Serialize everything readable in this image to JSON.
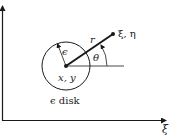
{
  "diagram": {
    "type": "geometry-figure",
    "colors": {
      "ink": "#1a1a1a",
      "background": "#ffffff"
    },
    "axes": {
      "horizontal_label": "ξ",
      "vertical_label": ""
    },
    "labels": {
      "point": "ξ, η",
      "radius_r": "r",
      "angle": "θ",
      "epsilon": "ϵ",
      "center": "x, y",
      "disk_caption": "ϵ disk"
    }
  }
}
